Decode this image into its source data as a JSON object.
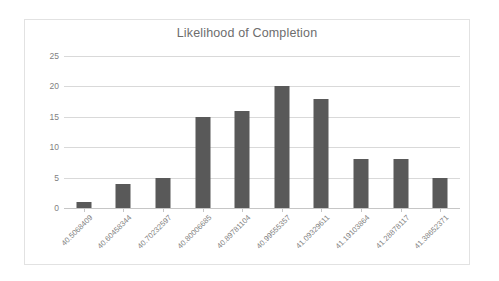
{
  "chart_data": {
    "type": "bar",
    "title": "Likelihood of Completion",
    "xlabel": "",
    "ylabel": "",
    "ylim": [
      0,
      25
    ],
    "yticks": [
      0,
      5,
      10,
      15,
      20,
      25
    ],
    "grid": true,
    "legend": false,
    "bar_color": "#595959",
    "gridline_color": "#d9d9d9",
    "text_color": "#7f7f7f",
    "categories": [
      "40.5068409",
      "40.60458344",
      "40.70232597",
      "40.80006685",
      "40.89781104",
      "40.99555357",
      "41.09329611",
      "41.19103864",
      "41.28878117",
      "41.38652371"
    ],
    "values": [
      1,
      4,
      5,
      15,
      16,
      20,
      18,
      8,
      8,
      5
    ]
  }
}
